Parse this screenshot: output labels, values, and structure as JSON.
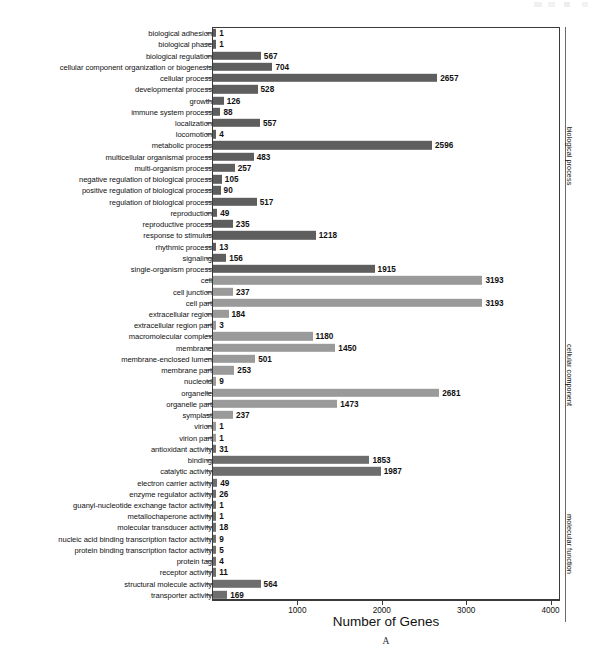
{
  "chart_data": {
    "type": "bar",
    "orientation": "horizontal",
    "title": "",
    "xlabel": "Number of Genes",
    "ylabel": "",
    "xlim": [
      0,
      4100
    ],
    "xticks": [
      1000,
      2000,
      3000,
      4000
    ],
    "xtick_labels": [
      "1000",
      "2000",
      "3000",
      "4000"
    ],
    "grid": false,
    "legend": "none",
    "panel_letter": "A",
    "group_colors": {
      "biological_process": "#5e5e5e",
      "cellular_component": "#9a9a9a",
      "molecular_function": "#6e6e6e"
    },
    "groups": [
      {
        "name": "biological process",
        "start_index": 0,
        "end_index": 22
      },
      {
        "name": "cellular component",
        "start_index": 23,
        "end_index": 38
      },
      {
        "name": "molecular function",
        "start_index": 39,
        "end_index": 52
      }
    ],
    "categories": [
      "biological adhesion",
      "biological phase",
      "biological regulation",
      "cellular component organization or biogenesis",
      "cellular process",
      "developmental process",
      "growth",
      "immune system process",
      "localization",
      "locomotion",
      "metabolic process",
      "multicellular organismal process",
      "multi-organism process",
      "negative regulation of biological process",
      "positive regulation of biological process",
      "regulation of biological process",
      "reproduction",
      "reproductive process",
      "response to stimulus",
      "rhythmic process",
      "signaling",
      "single-organism process",
      "cell",
      "cell junction",
      "cell part",
      "extracellular region",
      "extracellular region part",
      "macromolecular complex",
      "membrane",
      "membrane-enclosed lumen",
      "membrane part",
      "nucleoid",
      "organelle",
      "organelle part",
      "symplast",
      "virion",
      "virion part",
      "antioxidant activity",
      "binding",
      "catalytic activity",
      "electron carrier activity",
      "enzyme regulator activity",
      "guanyl-nucleotide exchange factor activity",
      "metallochaperone activity",
      "molecular transducer activity",
      "nucleic acid binding transcription factor activity",
      "protein binding transcription factor activity",
      "protein tag",
      "receptor activity",
      "structural molecule activity",
      "transporter activity"
    ],
    "values": [
      1,
      1,
      567,
      704,
      2657,
      528,
      126,
      88,
      557,
      4,
      2596,
      483,
      257,
      105,
      90,
      517,
      49,
      235,
      1218,
      13,
      156,
      1915,
      3193,
      237,
      3193,
      184,
      3,
      1180,
      1450,
      501,
      253,
      9,
      2681,
      1473,
      237,
      1,
      1,
      31,
      1853,
      1987,
      49,
      26,
      1,
      1,
      18,
      9,
      5,
      4,
      11,
      564,
      169
    ],
    "value_labels": [
      "1",
      "1",
      "567",
      "704",
      "2657",
      "528",
      "126",
      "88",
      "557",
      "4",
      "2596",
      "483",
      "257",
      "105",
      "90",
      "517",
      "49",
      "235",
      "1218",
      "13",
      "156",
      "1915",
      "3193",
      "237",
      "3193",
      "184",
      "3",
      "1180",
      "1450",
      "501",
      "253",
      "9",
      "2681",
      "1473",
      "237",
      "1",
      "1",
      "31",
      "1853",
      "1987",
      "49",
      "26",
      "1",
      "1",
      "18",
      "9",
      "5",
      "4",
      "11",
      "564",
      "169"
    ],
    "series_group": [
      "biological process",
      "biological process",
      "biological process",
      "biological process",
      "biological process",
      "biological process",
      "biological process",
      "biological process",
      "biological process",
      "biological process",
      "biological process",
      "biological process",
      "biological process",
      "biological process",
      "biological process",
      "biological process",
      "biological process",
      "biological process",
      "biological process",
      "biological process",
      "biological process",
      "biological process",
      "cellular component",
      "cellular component",
      "cellular component",
      "cellular component",
      "cellular component",
      "cellular component",
      "cellular component",
      "cellular component",
      "cellular component",
      "cellular component",
      "cellular component",
      "cellular component",
      "cellular component",
      "cellular component",
      "cellular component",
      "molecular function",
      "molecular function",
      "molecular function",
      "molecular function",
      "molecular function",
      "molecular function",
      "molecular function",
      "molecular function",
      "molecular function",
      "molecular function",
      "molecular function",
      "molecular function",
      "molecular function",
      "molecular function"
    ]
  }
}
